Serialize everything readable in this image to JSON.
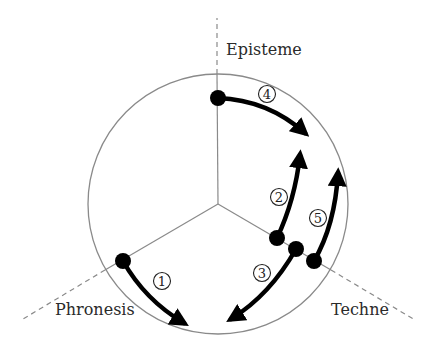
{
  "diagram": {
    "axes": [
      {
        "label": "Episteme",
        "label_x": 226,
        "label_y": 55
      },
      {
        "label": "Phronesis",
        "label_x": 55,
        "label_y": 315
      },
      {
        "label": "Techne",
        "label_x": 331,
        "label_y": 315
      }
    ],
    "steps": [
      {
        "number": "1",
        "label_x": 162,
        "label_y": 281
      },
      {
        "number": "2",
        "label_x": 279,
        "label_y": 197
      },
      {
        "number": "3",
        "label_x": 262,
        "label_y": 273
      },
      {
        "number": "4",
        "label_x": 267,
        "label_y": 94
      },
      {
        "number": "5",
        "label_x": 318,
        "label_y": 218
      }
    ],
    "colors": {
      "line": "#8a8a8a",
      "arrow": "#000000",
      "text": "#2a2a2a"
    }
  }
}
